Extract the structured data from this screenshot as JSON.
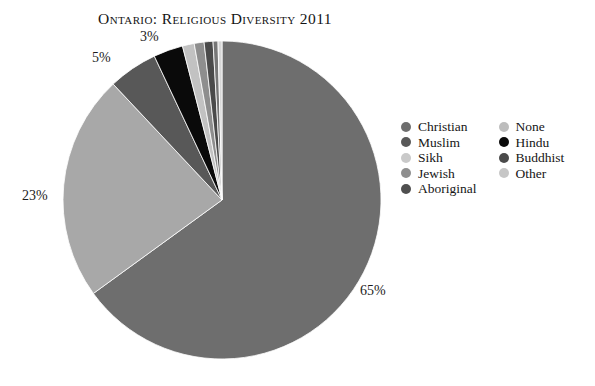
{
  "chart_data": {
    "type": "pie",
    "title": "Ontario: Religious Diversity 2011",
    "xlabel": "",
    "ylabel": "",
    "legend_position": "right",
    "grid": false,
    "categories": [
      "Christian",
      "None",
      "Muslim",
      "Hindu",
      "Sikh",
      "Jewish",
      "Buddhist",
      "Aboriginal",
      "Other"
    ],
    "values": [
      65,
      23,
      5,
      3,
      1.2,
      1.0,
      0.9,
      0.5,
      0.4
    ],
    "labels_shown": [
      "65%",
      "23%",
      "5%",
      "3%"
    ],
    "slices": [
      {
        "name": "Christian",
        "value": 65,
        "label": "65%",
        "color": "#6e6e6e"
      },
      {
        "name": "None",
        "value": 23,
        "label": "23%",
        "color": "#a8a8a8"
      },
      {
        "name": "Muslim",
        "value": 5,
        "label": "5%",
        "color": "#585858"
      },
      {
        "name": "Hindu",
        "value": 3,
        "label": "3%",
        "color": "#0a0a0a"
      },
      {
        "name": "Sikh",
        "value": 1.2,
        "label": "",
        "color": "#c2c2c2"
      },
      {
        "name": "Jewish",
        "value": 1.0,
        "label": "",
        "color": "#8e8e8e"
      },
      {
        "name": "Buddhist",
        "value": 0.9,
        "label": "",
        "color": "#4a4a4a"
      },
      {
        "name": "Aboriginal",
        "value": 0.5,
        "label": "",
        "color": "#767676"
      },
      {
        "name": "Other",
        "value": 0.4,
        "label": "",
        "color": "#d6d6d6"
      }
    ]
  },
  "labels": {
    "christian": "65%",
    "none": "23%",
    "muslim": "5%",
    "hindu": "3%"
  },
  "legend": {
    "columns": [
      {
        "items": [
          {
            "label": "Christian",
            "color": "#6e6e6e"
          },
          {
            "label": "Muslim",
            "color": "#585858"
          },
          {
            "label": "Sikh",
            "color": "#c9c9c9"
          },
          {
            "label": "Jewish",
            "color": "#8e8e8e"
          },
          {
            "label": "Aboriginal",
            "color": "#4f4f4f"
          }
        ]
      },
      {
        "items": [
          {
            "label": "None",
            "color": "#bdbdbd"
          },
          {
            "label": "Hindu",
            "color": "#0a0a0a"
          },
          {
            "label": "Buddhist",
            "color": "#4a4a4a"
          },
          {
            "label": "Other",
            "color": "#c6c6c6"
          }
        ]
      }
    ]
  },
  "colors": {
    "background": "#ffffff",
    "text": "#1a1a1a",
    "christian": "#6e6e6e",
    "none": "#a8a8a8",
    "muslim": "#585858",
    "hindu": "#0a0a0a"
  }
}
